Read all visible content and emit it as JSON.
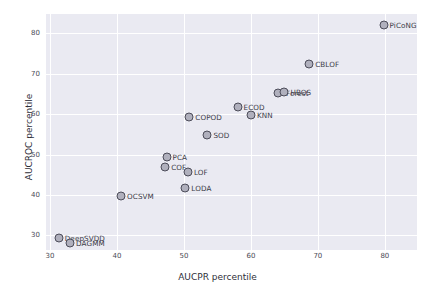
{
  "chart_data": {
    "type": "scatter",
    "title": "",
    "xlabel": "AUCPR percentile",
    "ylabel": "AUCROC percentile",
    "xlim": [
      29.4,
      84.8
    ],
    "ylim": [
      26.4,
      84.8
    ],
    "xticks": [
      30,
      40,
      50,
      60,
      70,
      80
    ],
    "yticks": [
      30,
      40,
      50,
      60,
      70,
      80
    ],
    "grid": true,
    "legend": "none",
    "marker_face_color": "#b0b0bd",
    "marker_edge_color": "#4c4c59",
    "plot_background": "#eaeaf2",
    "grid_color": "#ffffff",
    "points": [
      {
        "label": "DeepSVDD",
        "x": 31.3,
        "y": 29.3
      },
      {
        "label": "DAGMM",
        "x": 33.0,
        "y": 28.2
      },
      {
        "label": "OCSVM",
        "x": 40.6,
        "y": 39.8
      },
      {
        "label": "LODA",
        "x": 50.2,
        "y": 41.8
      },
      {
        "label": "LOF",
        "x": 50.6,
        "y": 45.7
      },
      {
        "label": "COF",
        "x": 47.2,
        "y": 47.0
      },
      {
        "label": "PCA",
        "x": 47.4,
        "y": 49.3
      },
      {
        "label": "SOD",
        "x": 53.5,
        "y": 54.8
      },
      {
        "label": "COPOD",
        "x": 50.8,
        "y": 59.3
      },
      {
        "label": "KNN",
        "x": 60.0,
        "y": 59.7
      },
      {
        "label": "ECOD",
        "x": 58.0,
        "y": 61.8
      },
      {
        "label": "IForest",
        "x": 64.0,
        "y": 65.2
      },
      {
        "label": "HBOS",
        "x": 65.0,
        "y": 65.6
      },
      {
        "label": "CBLOF",
        "x": 68.7,
        "y": 72.5
      },
      {
        "label": "PiCoNG",
        "x": 79.8,
        "y": 82.2
      }
    ]
  }
}
